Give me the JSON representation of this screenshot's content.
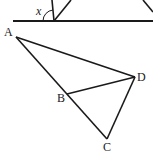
{
  "diagram": {
    "colors": {
      "stroke": "#1a1a1a",
      "background": "#ffffff"
    },
    "top_figure": {
      "angle_label": "x",
      "baseline": {
        "x1": 13,
        "y1": 21,
        "x2": 153,
        "y2": 21
      },
      "vertex": {
        "x": 54,
        "y": 21
      },
      "rays": [
        {
          "x1": 54,
          "y1": 21,
          "x2": 52,
          "y2": 0
        },
        {
          "x1": 54,
          "y1": 21,
          "x2": 71,
          "y2": 0
        },
        {
          "x1": 143,
          "y1": 0,
          "x2": 153,
          "y2": 12
        }
      ]
    },
    "bottom_figure": {
      "points": {
        "A": {
          "label": "A",
          "x": 16,
          "y": 37
        },
        "B": {
          "label": "B",
          "x": 67,
          "y": 92
        },
        "C": {
          "label": "C",
          "x": 107,
          "y": 139
        },
        "D": {
          "label": "D",
          "x": 135,
          "y": 77
        }
      },
      "segments": [
        "AD",
        "AC",
        "BD",
        "DC"
      ]
    }
  }
}
